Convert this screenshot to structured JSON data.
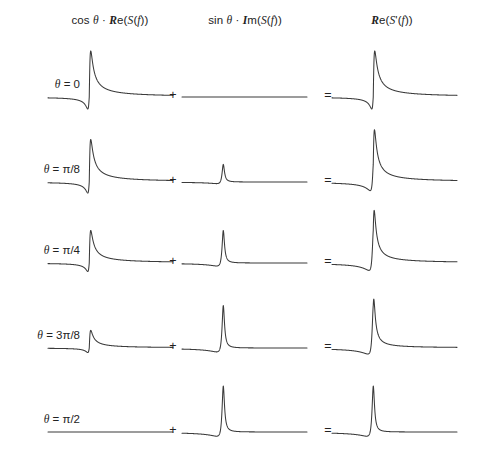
{
  "figure": {
    "background": "#ffffff",
    "curve_color": "#3b3b3b",
    "text_color": "#222222",
    "width": 477,
    "height": 462
  },
  "columns": [
    {
      "id": "real-term",
      "label": "cos θ · ℜe(S(f))",
      "center_x": 110,
      "header_y": 14
    },
    {
      "id": "imag-term",
      "label": "sin θ · ℐm(S(f))",
      "center_x": 245,
      "header_y": 14
    },
    {
      "id": "result",
      "label": "ℜe(S'(f))",
      "center_x": 392,
      "header_y": 14
    }
  ],
  "operators": [
    {
      "id": "plus",
      "symbol": "+",
      "x": 166
    },
    {
      "id": "equals",
      "symbol": "=",
      "x": 321
    }
  ],
  "rows": [
    {
      "id": "theta-0",
      "label": "θ = 0",
      "theta_deg": 0,
      "cos": 1.0,
      "sin": 0.0,
      "baseline_y": 97,
      "label_x": 14,
      "label_y": 78
    },
    {
      "id": "theta-pi-8",
      "label": "θ = π/8",
      "theta_deg": 22.5,
      "cos": 0.924,
      "sin": 0.383,
      "baseline_y": 182,
      "label_x": 14,
      "label_y": 163
    },
    {
      "id": "theta-pi-4",
      "label": "θ = π/4",
      "theta_deg": 45,
      "cos": 0.707,
      "sin": 0.707,
      "baseline_y": 263,
      "label_x": 14,
      "label_y": 244
    },
    {
      "id": "theta-3pi-8",
      "label": "θ = 3π/8",
      "theta_deg": 67.5,
      "cos": 0.383,
      "sin": 0.924,
      "baseline_y": 348,
      "label_x": 14,
      "label_y": 329
    },
    {
      "id": "theta-pi-2",
      "label": "θ = π/2",
      "theta_deg": 90,
      "cos": 0.0,
      "sin": 1.0,
      "baseline_y": 432,
      "label_x": 14,
      "label_y": 413
    }
  ],
  "chart_data": {
    "type": "line",
    "xlabel": "f",
    "ylabel": "",
    "grid": false,
    "legend": "none",
    "lineshape": {
      "model": "complex Lorentzian",
      "real_part": "dispersion: u/(1+u^2), antisymmetric, positive lobe before the centre then negative lobe after",
      "imag_part": "absorption-like: rendered as a sharp positive peak at the centre with a shallow negative lobe preceding it",
      "peak_center_fraction": 0.33,
      "halfwidth_fraction": 0.012
    },
    "panels": [
      {
        "row": "theta-0",
        "column": "real-term",
        "amplitude": 1.0,
        "shape": "dispersion"
      },
      {
        "row": "theta-0",
        "column": "imag-term",
        "amplitude": 0.0,
        "shape": "absorption"
      },
      {
        "row": "theta-0",
        "column": "result",
        "amplitude": 1.0,
        "shape": "sum"
      },
      {
        "row": "theta-pi-8",
        "column": "real-term",
        "amplitude": 0.924,
        "shape": "dispersion"
      },
      {
        "row": "theta-pi-8",
        "column": "imag-term",
        "amplitude": 0.383,
        "shape": "absorption"
      },
      {
        "row": "theta-pi-8",
        "column": "result",
        "amplitude": 1.0,
        "shape": "sum"
      },
      {
        "row": "theta-pi-4",
        "column": "real-term",
        "amplitude": 0.707,
        "shape": "dispersion"
      },
      {
        "row": "theta-pi-4",
        "column": "imag-term",
        "amplitude": 0.707,
        "shape": "absorption"
      },
      {
        "row": "theta-pi-4",
        "column": "result",
        "amplitude": 1.0,
        "shape": "sum"
      },
      {
        "row": "theta-3pi-8",
        "column": "real-term",
        "amplitude": 0.383,
        "shape": "dispersion"
      },
      {
        "row": "theta-3pi-8",
        "column": "imag-term",
        "amplitude": 0.924,
        "shape": "absorption"
      },
      {
        "row": "theta-3pi-8",
        "column": "result",
        "amplitude": 1.0,
        "shape": "sum"
      },
      {
        "row": "theta-pi-2",
        "column": "real-term",
        "amplitude": 0.0,
        "shape": "dispersion"
      },
      {
        "row": "theta-pi-2",
        "column": "imag-term",
        "amplitude": 1.0,
        "shape": "absorption"
      },
      {
        "row": "theta-pi-2",
        "column": "result",
        "amplitude": 1.0,
        "shape": "sum"
      }
    ],
    "panel_geometry": {
      "plot_width": 125,
      "plot_left_x": [
        48,
        182,
        332
      ],
      "dispersion_peak_height": 46,
      "dispersion_trough_depth": 12,
      "absorption_peak_height": 46,
      "absorption_dip_depth": 7
    }
  }
}
